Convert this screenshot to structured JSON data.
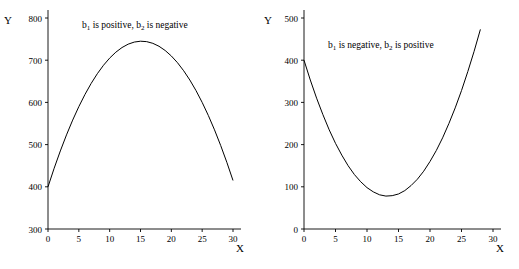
{
  "figure": {
    "background": "#ffffff",
    "curve_color": "#000000",
    "axis_color": "#000000"
  },
  "chart_data": [
    {
      "type": "line",
      "panel": "left",
      "title": "",
      "annotation": "b₁ is positive, b₂ is negative",
      "annotation_parts": {
        "pre": "b",
        "sub1": "1",
        "mid": " is positive, b",
        "sub2": "2",
        "post": " is negative"
      },
      "xlabel": "X",
      "ylabel": "Y",
      "xlim": [
        0,
        30
      ],
      "ylim": [
        300,
        800
      ],
      "xticks": [
        0,
        5,
        10,
        15,
        20,
        25,
        30
      ],
      "xticklabels": [
        "0",
        "5",
        "10",
        "15",
        "20",
        "25",
        "30"
      ],
      "yticks": [
        300,
        400,
        500,
        600,
        700,
        800
      ],
      "yticklabels": [
        "300",
        "400",
        "500",
        "600",
        "700",
        "800"
      ],
      "grid": false,
      "legend": "none",
      "x": [
        0,
        1,
        2,
        3,
        4,
        5,
        6,
        7,
        8,
        9,
        10,
        11,
        12,
        13,
        14,
        15,
        16,
        17,
        18,
        19,
        20,
        21,
        22,
        23,
        24,
        25,
        26,
        27,
        28,
        29,
        30
      ],
      "y": [
        400,
        444,
        485,
        523,
        558,
        590,
        619,
        645,
        668,
        688,
        705,
        719,
        730,
        738,
        743,
        745,
        744,
        740,
        733,
        723,
        710,
        694,
        675,
        653,
        628,
        600,
        569,
        535,
        498,
        458,
        415
      ]
    },
    {
      "type": "line",
      "panel": "right",
      "title": "",
      "annotation": "b₁ is negative, b₂ is positive",
      "annotation_parts": {
        "pre": "b",
        "sub1": "1",
        "mid": " is negative, b",
        "sub2": "2",
        "post": " is positive"
      },
      "xlabel": "X",
      "ylabel": "Y",
      "xlim": [
        0,
        30
      ],
      "ylim": [
        0,
        500
      ],
      "xticks": [
        0,
        5,
        10,
        15,
        20,
        25,
        30
      ],
      "xticklabels": [
        "0",
        "5",
        "10",
        "15",
        "20",
        "25",
        "30"
      ],
      "yticks": [
        0,
        100,
        200,
        300,
        400,
        500
      ],
      "yticklabels": [
        "0",
        "100",
        "200",
        "300",
        "400",
        "500"
      ],
      "grid": false,
      "legend": "none",
      "x": [
        0,
        1,
        2,
        3,
        4,
        5,
        6,
        7,
        8,
        9,
        10,
        11,
        12,
        13,
        14,
        15,
        16,
        17,
        18,
        19,
        20,
        21,
        22,
        23,
        24,
        25,
        26,
        27,
        28,
        29,
        30
      ],
      "y": [
        400,
        353,
        310,
        271,
        235,
        203,
        175,
        150,
        129,
        112,
        98,
        88,
        81,
        78,
        79,
        83,
        91,
        103,
        118,
        137,
        160,
        186,
        216,
        250,
        287,
        328,
        373,
        421,
        473,
        529,
        588
      ]
    }
  ]
}
